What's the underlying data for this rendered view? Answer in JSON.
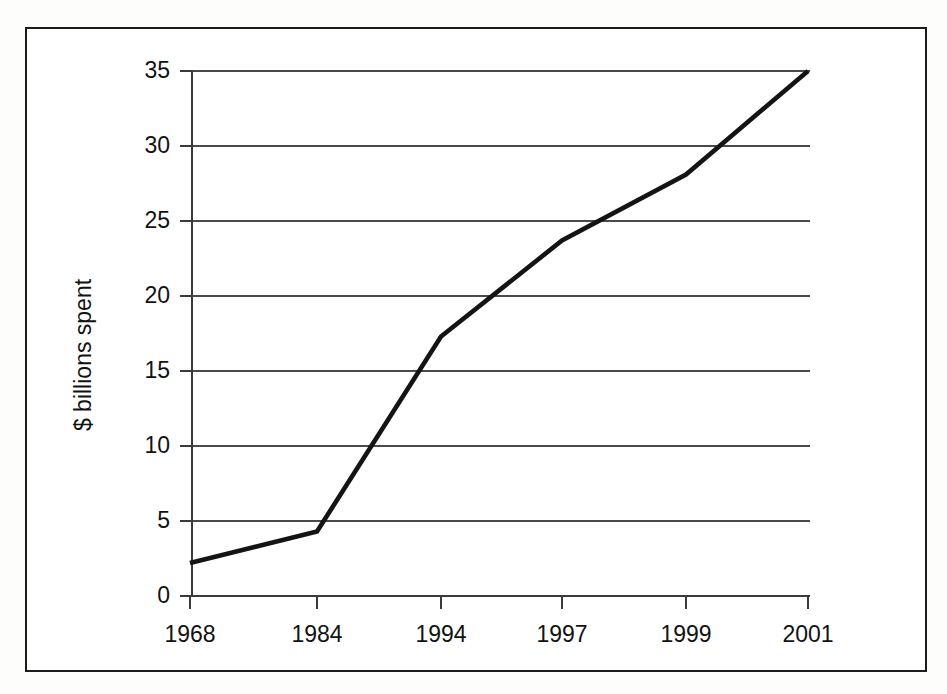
{
  "chart_data": {
    "type": "line",
    "title": "",
    "xlabel": "",
    "ylabel": "$ billions spent",
    "categories": [
      "1968",
      "1984",
      "1994",
      "1997",
      "1999",
      "2001"
    ],
    "values": [
      2.2,
      4.3,
      17.3,
      23.7,
      28.1,
      35.0
    ],
    "series": [
      {
        "name": "$ billions spent",
        "values": [
          2.2,
          4.3,
          17.3,
          23.7,
          28.1,
          35.0
        ]
      }
    ],
    "ylim": [
      0,
      35
    ],
    "yticks": [
      0,
      5,
      10,
      15,
      20,
      25,
      30,
      35
    ],
    "ytick_labels": [
      "0",
      "5",
      "10",
      "15",
      "20",
      "25",
      "30",
      "35"
    ],
    "xtick_labels": [
      "1968",
      "1984",
      "1994",
      "1997",
      "1999",
      "2001"
    ],
    "grid": true,
    "grid_axis": "y",
    "legend": false,
    "legend_position": "none",
    "line_color": "#141414",
    "grid_color": "#4a4a4a",
    "background_color": "#ffffff",
    "border_color": "#1c1c1c"
  },
  "axes": {
    "y_axis_title": "$ billions spent",
    "y_tick_0": "0",
    "y_tick_5": "5",
    "y_tick_10": "10",
    "y_tick_15": "15",
    "y_tick_20": "20",
    "y_tick_25": "25",
    "y_tick_30": "30",
    "y_tick_35": "35",
    "x_tick_1": "1968",
    "x_tick_2": "1984",
    "x_tick_3": "1994",
    "x_tick_4": "1997",
    "x_tick_5": "1999",
    "x_tick_6": "2001"
  }
}
